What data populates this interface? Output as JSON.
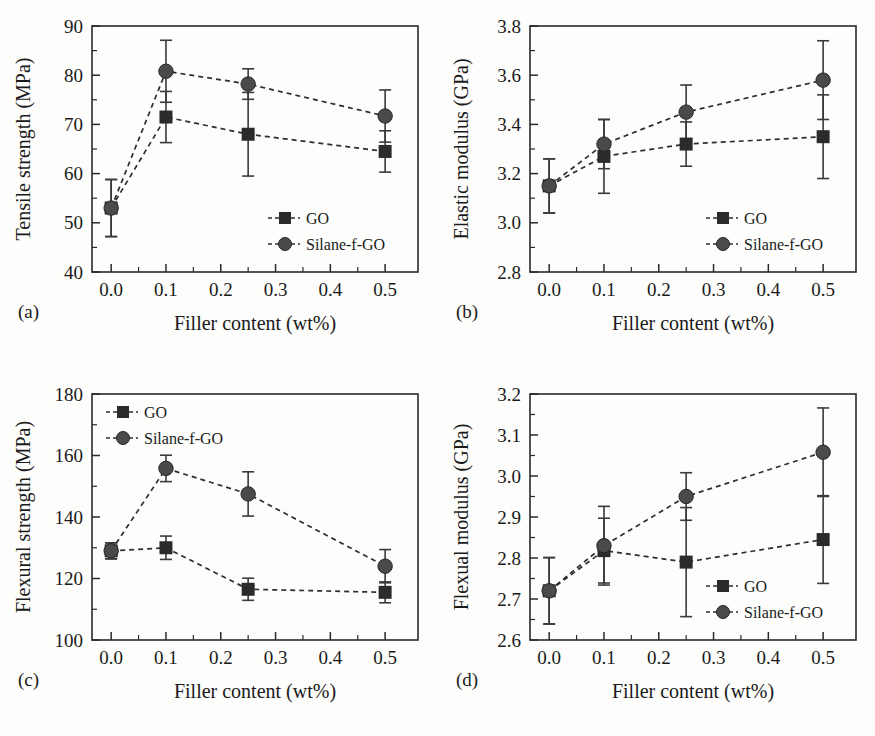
{
  "figure": {
    "panel_letters": [
      "(a)",
      "(b)",
      "(c)",
      "(d)"
    ],
    "shared_xlabel": "Filler content (wt%)",
    "shared_xticks": [
      "0.0",
      "0.1",
      "0.2",
      "0.3",
      "0.4",
      "0.5"
    ],
    "series_names": [
      "GO",
      "Silane-f-GO"
    ],
    "marker_colors": {
      "GO": "#2b2b2b",
      "Silane-f-GO": "#4a4a4a",
      "line": "#2e2e2e",
      "axis": "#2a2a2a",
      "background": "#fdfdfb"
    }
  },
  "chart_data": [
    {
      "type": "line",
      "panel": "(a)",
      "title": "",
      "xlabel": "Filler content (wt%)",
      "ylabel": "Tensile strength (MPa)",
      "x": [
        0.0,
        0.1,
        0.25,
        0.5
      ],
      "xlim": [
        -0.035,
        0.56
      ],
      "ylim": [
        40,
        90
      ],
      "yticks": [
        40,
        50,
        60,
        70,
        80,
        90
      ],
      "ytick_labels": [
        "40",
        "50",
        "60",
        "70",
        "80",
        "90"
      ],
      "xticks": [
        0.0,
        0.1,
        0.2,
        0.3,
        0.4,
        0.5
      ],
      "xtick_labels": [
        "0.0",
        "0.1",
        "0.2",
        "0.3",
        "0.4",
        "0.5"
      ],
      "grid": false,
      "legend_position": "bottom-right",
      "series": [
        {
          "name": "GO",
          "marker": "square",
          "values": [
            53.0,
            71.5,
            68.0,
            64.5
          ],
          "errors": [
            5.8,
            5.2,
            8.5,
            4.2
          ]
        },
        {
          "name": "Silane-f-GO",
          "marker": "circle",
          "values": [
            53.0,
            80.8,
            78.2,
            71.7
          ],
          "errors": [
            5.8,
            6.3,
            3.1,
            5.3
          ]
        }
      ]
    },
    {
      "type": "line",
      "panel": "(b)",
      "title": "",
      "xlabel": "Filler content (wt%)",
      "ylabel": "Elastic modulus (GPa)",
      "x": [
        0.0,
        0.1,
        0.25,
        0.5
      ],
      "xlim": [
        -0.035,
        0.56
      ],
      "ylim": [
        2.8,
        3.8
      ],
      "yticks": [
        2.8,
        3.0,
        3.2,
        3.4,
        3.6,
        3.8
      ],
      "ytick_labels": [
        "2.8",
        "3.0",
        "3.2",
        "3.4",
        "3.6",
        "3.8"
      ],
      "xticks": [
        0.0,
        0.1,
        0.2,
        0.3,
        0.4,
        0.5
      ],
      "xtick_labels": [
        "0.0",
        "0.1",
        "0.2",
        "0.3",
        "0.4",
        "0.5"
      ],
      "grid": false,
      "legend_position": "bottom-right",
      "series": [
        {
          "name": "GO",
          "marker": "square",
          "values": [
            3.15,
            3.27,
            3.32,
            3.35
          ],
          "errors": [
            0.11,
            0.15,
            0.09,
            0.17
          ]
        },
        {
          "name": "Silane-f-GO",
          "marker": "circle",
          "values": [
            3.15,
            3.32,
            3.45,
            3.58
          ],
          "errors": [
            0.11,
            0.1,
            0.11,
            0.16
          ]
        }
      ]
    },
    {
      "type": "line",
      "panel": "(c)",
      "title": "",
      "xlabel": "Filler content (wt%)",
      "ylabel": "Flexural strength (MPa)",
      "x": [
        0.0,
        0.1,
        0.25,
        0.5
      ],
      "xlim": [
        -0.035,
        0.56
      ],
      "ylim": [
        100,
        180
      ],
      "yticks": [
        100,
        120,
        140,
        160,
        180
      ],
      "ytick_labels": [
        "100",
        "120",
        "140",
        "160",
        "180"
      ],
      "xticks": [
        0.0,
        0.1,
        0.2,
        0.3,
        0.4,
        0.5
      ],
      "xtick_labels": [
        "0.0",
        "0.1",
        "0.2",
        "0.3",
        "0.4",
        "0.5"
      ],
      "grid": false,
      "legend_position": "top-left",
      "series": [
        {
          "name": "GO",
          "marker": "square",
          "values": [
            129.0,
            130.0,
            116.5,
            115.5
          ],
          "errors": [
            2.6,
            3.8,
            3.6,
            3.4
          ]
        },
        {
          "name": "Silane-f-GO",
          "marker": "circle",
          "values": [
            129.0,
            155.8,
            147.5,
            124.0
          ],
          "errors": [
            2.6,
            4.3,
            7.2,
            5.4
          ]
        }
      ]
    },
    {
      "type": "line",
      "panel": "(d)",
      "title": "",
      "xlabel": "Filler content (wt%)",
      "ylabel": "Flexual modulus (GPa)",
      "x": [
        0.0,
        0.1,
        0.25,
        0.5
      ],
      "xlim": [
        -0.035,
        0.56
      ],
      "ylim": [
        2.6,
        3.2
      ],
      "yticks": [
        2.6,
        2.7,
        2.8,
        2.9,
        3.0,
        3.1,
        3.2
      ],
      "ytick_labels": [
        "2.6",
        "2.7",
        "2.8",
        "2.9",
        "3.0",
        "3.1",
        "3.2"
      ],
      "xticks": [
        0.0,
        0.1,
        0.2,
        0.3,
        0.4,
        0.5
      ],
      "xtick_labels": [
        "0.0",
        "0.1",
        "0.2",
        "0.3",
        "0.4",
        "0.5"
      ],
      "grid": false,
      "legend_position": "bottom-right",
      "series": [
        {
          "name": "GO",
          "marker": "square",
          "values": [
            2.72,
            2.818,
            2.79,
            2.845
          ],
          "errors": [
            0.081,
            0.079,
            0.133,
            0.107
          ]
        },
        {
          "name": "Silane-f-GO",
          "marker": "circle",
          "values": [
            2.72,
            2.83,
            2.95,
            3.058
          ],
          "errors": [
            0.081,
            0.096,
            0.058,
            0.108
          ]
        }
      ]
    }
  ]
}
